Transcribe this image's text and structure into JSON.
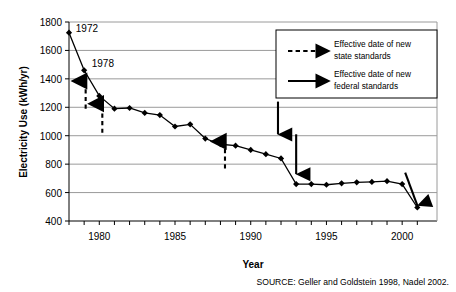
{
  "chart_data": {
    "type": "line",
    "title": "",
    "xlabel": "Year",
    "ylabel": "Electricity Use (kWh/yr)",
    "xlim": [
      1978,
      2001
    ],
    "ylim": [
      400,
      1800
    ],
    "ytick_step": 200,
    "yticks": [
      400,
      600,
      800,
      1000,
      1200,
      1400,
      1600,
      1800
    ],
    "xticks_labeled": [
      1980,
      1985,
      1990,
      1995,
      2000
    ],
    "xticks_minor_every": 1,
    "grid": "horizontal",
    "legend_position": "top-right",
    "series": [
      {
        "name": "Electricity Use",
        "x": [
          1978,
          1979,
          1980,
          1981,
          1982,
          1983,
          1984,
          1985,
          1986,
          1987,
          1988,
          1989,
          1990,
          1991,
          1992,
          1993,
          1994,
          1995,
          1996,
          1997,
          1998,
          1999,
          2000,
          2001
        ],
        "values": [
          1725,
          1460,
          1280,
          1190,
          1195,
          1160,
          1145,
          1065,
          1080,
          980,
          940,
          930,
          900,
          870,
          840,
          660,
          660,
          655,
          665,
          672,
          675,
          680,
          660,
          495
        ]
      }
    ],
    "point_annotations": [
      {
        "label": "1972",
        "x": 1978.45,
        "y": 1730
      },
      {
        "label": "1978",
        "x": 1979.5,
        "y": 1480
      }
    ],
    "arrows": [
      {
        "kind": "state",
        "style": "dashed",
        "x": 1979.1,
        "y_from": 1190,
        "y_to": 1385,
        "direction": "up"
      },
      {
        "kind": "state",
        "style": "dashed",
        "x": 1980.2,
        "y_from": 1020,
        "y_to": 1225,
        "direction": "up"
      },
      {
        "kind": "state",
        "style": "dashed",
        "x": 1988.3,
        "y_from": 770,
        "y_to": 960,
        "direction": "up"
      },
      {
        "kind": "federal",
        "style": "solid",
        "x": 1991.8,
        "y_from": 1240,
        "y_to": 1010,
        "direction": "down"
      },
      {
        "kind": "federal",
        "style": "solid",
        "x": 1993.0,
        "y_from": 1010,
        "y_to": 730,
        "direction": "down"
      },
      {
        "kind": "federal",
        "style": "solid",
        "x_from": 2000.2,
        "y_from": 740,
        "x_to": 2001.0,
        "y_to": 510,
        "direction": "down-right",
        "slanted": true
      }
    ]
  },
  "legend": {
    "items": [
      {
        "key": "state-standards",
        "style": "dashed",
        "line1": "Effective date of new",
        "line2": "state standards"
      },
      {
        "key": "federal-standards",
        "style": "solid",
        "line1": "Effective date of new",
        "line2": "federal standards"
      }
    ]
  },
  "source": {
    "text": "SOURCE: Geller and Goldstein 1998, Nadel 2002."
  },
  "colors": {
    "line": "#000000",
    "marker": "#000000",
    "grid": "#808080",
    "axis": "#000000",
    "background": "#ffffff",
    "legend_border": "#000000"
  }
}
